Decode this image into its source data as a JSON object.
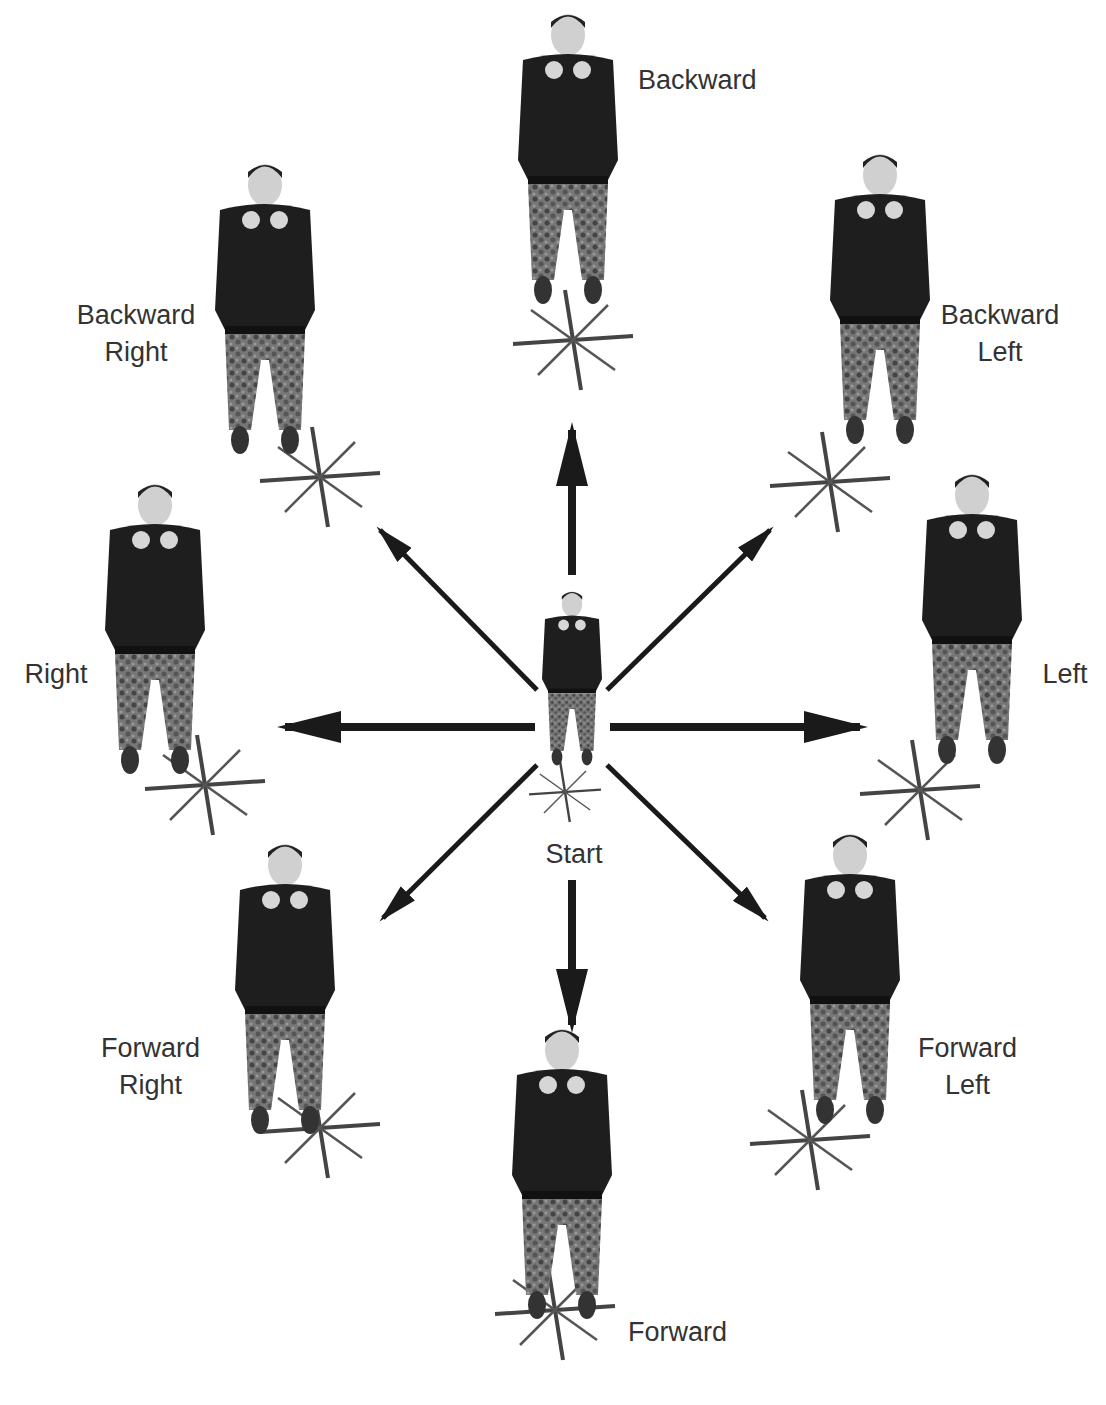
{
  "center": {
    "label": "Start"
  },
  "positions": [
    {
      "id": "backward",
      "label": "Backward"
    },
    {
      "id": "backward-left",
      "label": "Backward\nLeft"
    },
    {
      "id": "left",
      "label": "Left"
    },
    {
      "id": "forward-left",
      "label": "Forward\nLeft"
    },
    {
      "id": "forward",
      "label": "Forward"
    },
    {
      "id": "forward-right",
      "label": "Forward\nRight"
    },
    {
      "id": "right",
      "label": "Right"
    },
    {
      "id": "backward-right",
      "label": "Backward\nRight"
    }
  ],
  "colors": {
    "arrow": "#1a1a1a",
    "shirt": "#1e1e1e",
    "pants": "#6b6b6b",
    "skin": "#d8d8d8",
    "star": "#444444",
    "text": "#333333"
  }
}
